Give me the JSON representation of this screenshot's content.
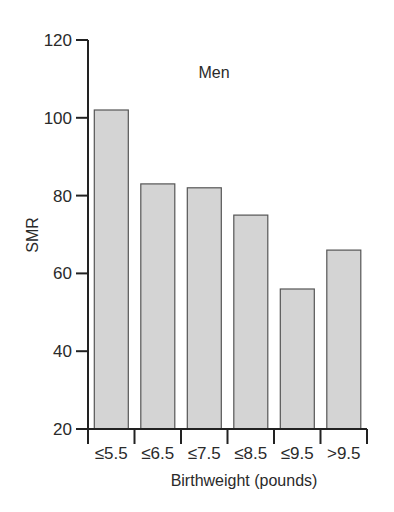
{
  "chart_data": {
    "type": "bar",
    "title": "Men",
    "xlabel": "Birthweight (pounds)",
    "ylabel": "SMR",
    "categories": [
      "≤5.5",
      "≤6.5",
      "≤7.5",
      "≤8.5",
      "≤9.5",
      ">9.5"
    ],
    "values": [
      102,
      83,
      82,
      75,
      56,
      66
    ],
    "ylim": [
      20,
      120
    ],
    "yticks": [
      20,
      40,
      60,
      80,
      100,
      120
    ],
    "grid": false,
    "legend": null,
    "bar_color": "#d4d4d4",
    "bar_edge_color": "#555555"
  }
}
